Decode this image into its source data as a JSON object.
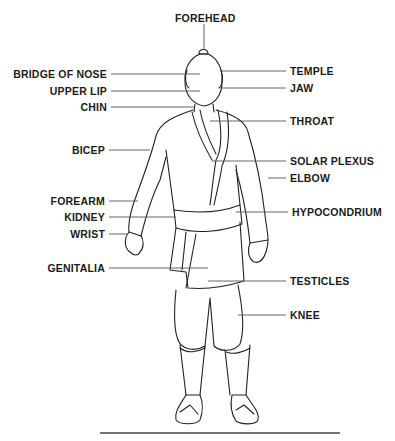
{
  "diagram": {
    "type": "anatomical-labeled-figure",
    "labels_left": [
      {
        "text": "BRIDGE OF NOSE",
        "y": 74
      },
      {
        "text": "UPPER LIP",
        "y": 91
      },
      {
        "text": "CHIN",
        "y": 107
      },
      {
        "text": "BICEP",
        "y": 150
      },
      {
        "text": "FOREARM",
        "y": 201
      },
      {
        "text": "KIDNEY",
        "y": 217
      },
      {
        "text": "WRIST",
        "y": 234
      },
      {
        "text": "GENITALIA",
        "y": 268
      }
    ],
    "labels_right": [
      {
        "text": "TEMPLE",
        "y": 71
      },
      {
        "text": "JAW",
        "y": 88
      },
      {
        "text": "THROAT",
        "y": 121
      },
      {
        "text": "SOLAR PLEXUS",
        "y": 161
      },
      {
        "text": "ELBOW",
        "y": 178
      },
      {
        "text": "HYPOCONDRIUM",
        "y": 212
      },
      {
        "text": "TESTICLES",
        "y": 281
      },
      {
        "text": "KNEE",
        "y": 315
      }
    ],
    "label_top": {
      "text": "FOREHEAD",
      "y": 18
    }
  }
}
